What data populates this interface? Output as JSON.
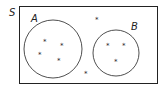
{
  "diagram": {
    "type": "venn",
    "universal_set": {
      "label": "S"
    },
    "sets": [
      {
        "label": "A",
        "elements": 4
      },
      {
        "label": "B",
        "elements": 3
      }
    ],
    "outside_elements": 2,
    "element_symbol": "*",
    "colors": {
      "stroke": "#222222",
      "background": "#ffffff"
    }
  }
}
